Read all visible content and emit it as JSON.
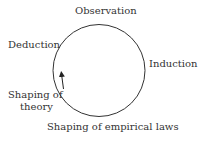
{
  "diagram": {
    "title": "",
    "labels": {
      "top": "Observation",
      "right": "Induction",
      "bottom": "Shaping of empirical laws",
      "bottom_left_line1": "Shaping of",
      "bottom_left_line2": "theory",
      "left": "Deduction"
    },
    "cycle_direction": "counterclockwise",
    "colors": {
      "stroke": "#333333",
      "text": "#333333"
    }
  }
}
